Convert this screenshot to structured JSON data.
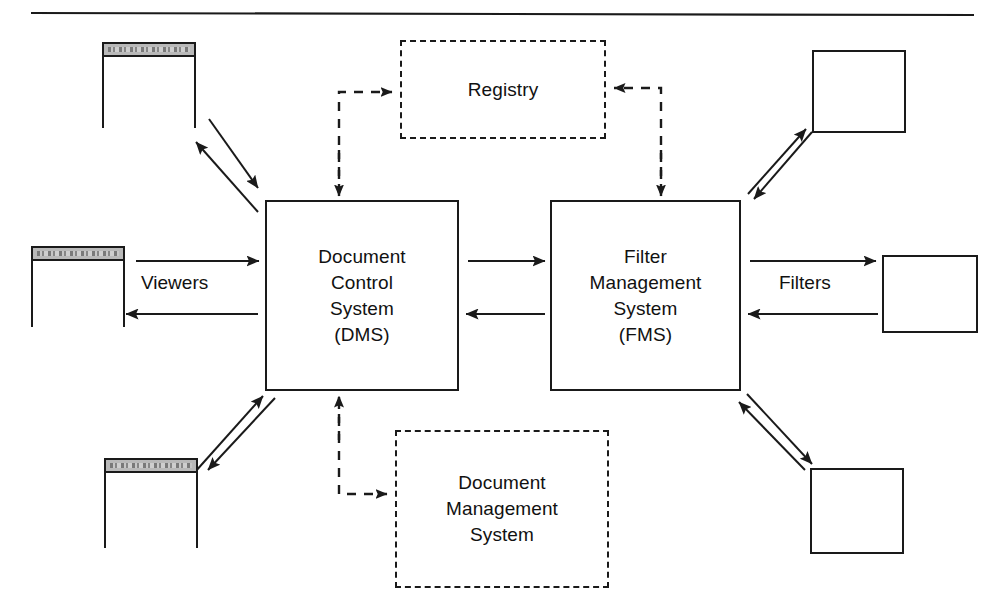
{
  "diagram": {
    "title_rule": "horizontal-rule",
    "nodes": {
      "dms_control": {
        "label": "Document\nControl\nSystem\n(DMS)",
        "style": "solid",
        "x": 265,
        "y": 200,
        "w": 194,
        "h": 191
      },
      "fms": {
        "label": "Filter\nManagement\nSystem\n(FMS)",
        "style": "solid",
        "x": 550,
        "y": 200,
        "w": 191,
        "h": 191
      },
      "registry": {
        "label": "Registry",
        "style": "dashed",
        "x": 400,
        "y": 40,
        "w": 206,
        "h": 99
      },
      "document_management": {
        "label": "Document\nManagement\nSystem",
        "style": "dashed",
        "x": 395,
        "y": 430,
        "w": 214,
        "h": 158
      }
    },
    "windows": [
      {
        "name": "viewer-window-top-left",
        "x": 102,
        "y": 42,
        "w": 94,
        "h": 86
      },
      {
        "name": "viewer-window-middle-left",
        "x": 31,
        "y": 246,
        "w": 94,
        "h": 81
      },
      {
        "name": "viewer-window-bottom-left",
        "x": 104,
        "y": 458,
        "w": 94,
        "h": 90
      }
    ],
    "plain_boxes": [
      {
        "name": "filter-box-top-right",
        "x": 812,
        "y": 50,
        "w": 94,
        "h": 83
      },
      {
        "name": "filter-box-middle-right",
        "x": 882,
        "y": 255,
        "w": 96,
        "h": 78
      },
      {
        "name": "filter-box-bottom-right",
        "x": 810,
        "y": 468,
        "w": 94,
        "h": 86
      }
    ],
    "edge_labels": {
      "viewers": "Viewers",
      "filters": "Filters"
    },
    "colors": {
      "stroke": "#1a1a1a",
      "background": "#ffffff",
      "titlebar": "#b9b9b9"
    }
  }
}
